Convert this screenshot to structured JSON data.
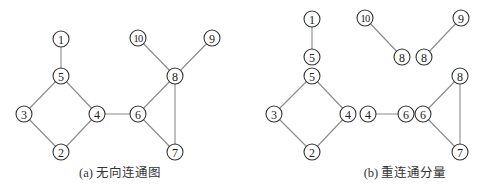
{
  "panels": [
    {
      "id": "a",
      "caption": "(a) 无向连通图",
      "caption_x": 120,
      "nodes": [
        {
          "id": "n1",
          "label": "1",
          "x": 61,
          "y": 39
        },
        {
          "id": "n5",
          "label": "5",
          "x": 61,
          "y": 76
        },
        {
          "id": "n3",
          "label": "3",
          "x": 24,
          "y": 114
        },
        {
          "id": "n4",
          "label": "4",
          "x": 97,
          "y": 114
        },
        {
          "id": "n2",
          "label": "2",
          "x": 61,
          "y": 152
        },
        {
          "id": "n6",
          "label": "6",
          "x": 138,
          "y": 114
        },
        {
          "id": "n7",
          "label": "7",
          "x": 175,
          "y": 152
        },
        {
          "id": "n8",
          "label": "8",
          "x": 175,
          "y": 76
        },
        {
          "id": "n10",
          "label": "10",
          "x": 138,
          "y": 38
        },
        {
          "id": "n9",
          "label": "9",
          "x": 212,
          "y": 38
        }
      ],
      "edges": [
        [
          "n1",
          "n5"
        ],
        [
          "n5",
          "n3"
        ],
        [
          "n5",
          "n4"
        ],
        [
          "n3",
          "n2"
        ],
        [
          "n4",
          "n2"
        ],
        [
          "n4",
          "n6"
        ],
        [
          "n6",
          "n8"
        ],
        [
          "n6",
          "n7"
        ],
        [
          "n8",
          "n7"
        ],
        [
          "n10",
          "n8"
        ],
        [
          "n9",
          "n8"
        ]
      ]
    },
    {
      "id": "b",
      "caption": "(b) 重连通分量",
      "caption_x": 405,
      "nodes": [
        {
          "id": "b1",
          "label": "1",
          "x": 312,
          "y": 19
        },
        {
          "id": "b5a",
          "label": "5",
          "x": 312,
          "y": 57
        },
        {
          "id": "b5b",
          "label": "5",
          "x": 312,
          "y": 76
        },
        {
          "id": "b3",
          "label": "3",
          "x": 274,
          "y": 114
        },
        {
          "id": "b4a",
          "label": "4",
          "x": 348,
          "y": 114
        },
        {
          "id": "b2",
          "label": "2",
          "x": 312,
          "y": 152
        },
        {
          "id": "b10",
          "label": "10",
          "x": 365,
          "y": 18
        },
        {
          "id": "b8a",
          "label": "8",
          "x": 402,
          "y": 57
        },
        {
          "id": "b8b",
          "label": "8",
          "x": 424,
          "y": 57
        },
        {
          "id": "b9",
          "label": "9",
          "x": 461,
          "y": 18
        },
        {
          "id": "b4b",
          "label": "4",
          "x": 368,
          "y": 114
        },
        {
          "id": "b6a",
          "label": "6",
          "x": 406,
          "y": 114
        },
        {
          "id": "b6b",
          "label": "6",
          "x": 423,
          "y": 114
        },
        {
          "id": "b8c",
          "label": "8",
          "x": 460,
          "y": 76
        },
        {
          "id": "b7",
          "label": "7",
          "x": 460,
          "y": 152
        }
      ],
      "edges": [
        [
          "b1",
          "b5a"
        ],
        [
          "b5b",
          "b3"
        ],
        [
          "b5b",
          "b4a"
        ],
        [
          "b3",
          "b2"
        ],
        [
          "b4a",
          "b2"
        ],
        [
          "b10",
          "b8a"
        ],
        [
          "b9",
          "b8b"
        ],
        [
          "b4b",
          "b6a"
        ],
        [
          "b6b",
          "b8c"
        ],
        [
          "b6b",
          "b7"
        ],
        [
          "b8c",
          "b7"
        ]
      ]
    }
  ],
  "style": {
    "node_radius": 8,
    "node_stroke": "#333333",
    "edge_stroke": "#8a8a8a",
    "background": "#ffffff"
  }
}
